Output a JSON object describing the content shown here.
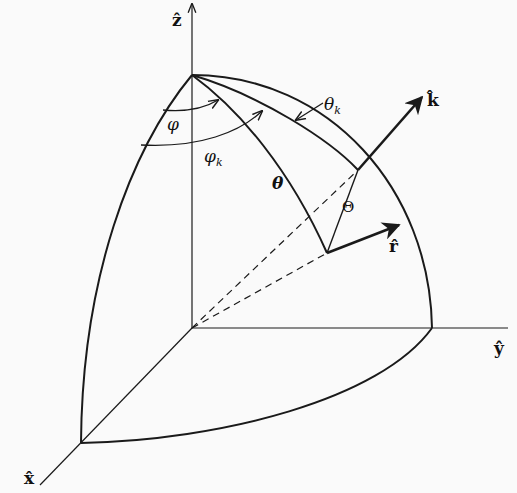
{
  "diagram": {
    "axes": {
      "x": "x̂",
      "y": "ŷ",
      "z": "ẑ"
    },
    "vectors": {
      "k": "k̂",
      "r": "r̂"
    },
    "angles": {
      "phi": "φ",
      "phi_k": "φ",
      "phi_k_sub": "k",
      "theta": "θ",
      "theta_k": "θ",
      "theta_k_sub": "k",
      "Theta": "Θ"
    },
    "colors": {
      "line": "#1a1a1a",
      "background": "#fafafa"
    }
  }
}
